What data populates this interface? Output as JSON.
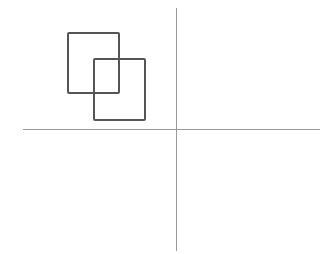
{
  "diagram": {
    "background": "#ffffff",
    "axes": {
      "color": "#9a9a9a",
      "horizontal": {
        "x1": 23,
        "y": 129,
        "x2": 320
      },
      "vertical": {
        "x": 176,
        "y1": 8,
        "y2": 251
      }
    },
    "rectangles": [
      {
        "x": 68,
        "y": 33,
        "width": 51,
        "height": 60,
        "stroke": "#555555"
      },
      {
        "x": 94,
        "y": 59,
        "width": 51,
        "height": 61,
        "stroke": "#555555"
      }
    ]
  }
}
